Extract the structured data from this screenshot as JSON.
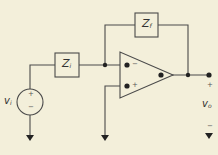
{
  "diagram": {
    "background": "#f3efda",
    "line_color": "#4a4a4a",
    "components": {
      "input_impedance": {
        "label": "Z",
        "subscript": "i"
      },
      "feedback_impedance": {
        "label": "Z",
        "subscript": "f"
      },
      "source": {
        "label": "v",
        "subscript": "i",
        "plus": "+",
        "minus": "−"
      },
      "opamp": {
        "inverting": "−",
        "noninverting": "+"
      },
      "output": {
        "label": "v",
        "subscript": "o",
        "plus": "+",
        "minus": "−"
      }
    }
  }
}
